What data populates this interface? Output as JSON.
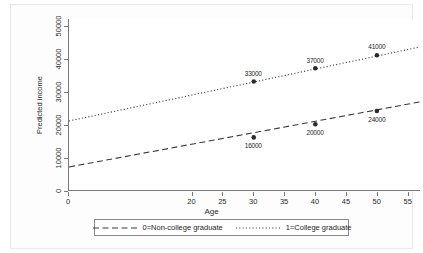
{
  "chart_data": {
    "type": "line",
    "title": "",
    "xlabel": "Age",
    "ylabel": "Predicted income",
    "xlim": [
      0,
      57
    ],
    "ylim": [
      0,
      52000
    ],
    "grid": false,
    "legend_position": "bottom",
    "x_ticks": [
      {
        "value": 0,
        "label": "0"
      },
      {
        "value": 20,
        "label": "20"
      },
      {
        "value": 25,
        "label": "25"
      },
      {
        "value": 30,
        "label": "30"
      },
      {
        "value": 35,
        "label": "35"
      },
      {
        "value": 40,
        "label": "40"
      },
      {
        "value": 45,
        "label": "45"
      },
      {
        "value": 50,
        "label": "50"
      },
      {
        "value": 55,
        "label": "55"
      }
    ],
    "y_ticks": [
      {
        "value": 0,
        "label": "0"
      },
      {
        "value": 10000,
        "label": "10000"
      },
      {
        "value": 20000,
        "label": "20000"
      },
      {
        "value": 30000,
        "label": "30000"
      },
      {
        "value": 40000,
        "label": "40000"
      },
      {
        "value": 50000,
        "label": "50000"
      }
    ],
    "series": [
      {
        "name": "0=Non-college graduate",
        "legend_label": "0=Non-college graduate",
        "style": "dashed",
        "color": "#3a3a3a",
        "line": {
          "x0": 0,
          "y0": 7000,
          "x1": 57,
          "y1": 26800
        },
        "points": [
          {
            "x": 30,
            "y": 16000,
            "label": "16000",
            "label_pos": "below"
          },
          {
            "x": 40,
            "y": 20000,
            "label": "20000",
            "label_pos": "below"
          },
          {
            "x": 50,
            "y": 24000,
            "label": "24000",
            "label_pos": "below"
          }
        ]
      },
      {
        "name": "1=College graduate",
        "legend_label": "1=College graduate",
        "style": "dotted",
        "color": "#3a3a3a",
        "line": {
          "x0": 0,
          "y0": 21000,
          "x1": 57,
          "y1": 43500
        },
        "points": [
          {
            "x": 30,
            "y": 33000,
            "label": "33000",
            "label_pos": "above"
          },
          {
            "x": 40,
            "y": 37000,
            "label": "37000",
            "label_pos": "above"
          },
          {
            "x": 50,
            "y": 41000,
            "label": "41000",
            "label_pos": "above"
          }
        ]
      }
    ]
  }
}
